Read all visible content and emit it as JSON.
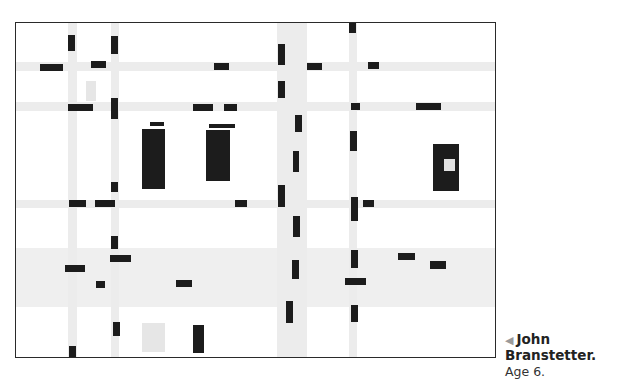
{
  "artwork": {
    "description": "Mondrian-style grid painting with light gray stripes and black rectangles",
    "colors": {
      "stripe": "#ececec",
      "block": "#1c1c1c",
      "frame": "#2a2a2a",
      "light_square": "#e6e6e6"
    }
  },
  "caption": {
    "arrow": "◀",
    "name": "John Branstetter.",
    "age": "Age 6."
  }
}
